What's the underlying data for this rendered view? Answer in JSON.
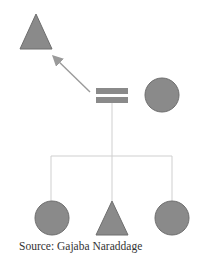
{
  "diagram": {
    "colors": {
      "shape_fill": "#8a8a8a",
      "shape_stroke": "#6e6e6e",
      "line": "#cfcfcf",
      "arrow": "#9a9a9a"
    },
    "nodes": [
      {
        "id": "parent-triangle",
        "shape": "triangle",
        "role": "male (top-left)"
      },
      {
        "id": "marriage-symbol",
        "shape": "equals",
        "role": "marriage"
      },
      {
        "id": "spouse-circle",
        "shape": "circle",
        "role": "female spouse"
      },
      {
        "id": "child-circle-left",
        "shape": "circle",
        "role": "female child"
      },
      {
        "id": "child-triangle",
        "shape": "triangle",
        "role": "male child"
      },
      {
        "id": "child-circle-right",
        "shape": "circle",
        "role": "female child"
      }
    ],
    "edges": [
      {
        "from": "marriage-symbol",
        "to": "parent-triangle",
        "type": "arrow"
      },
      {
        "from": "marriage-symbol",
        "to": "children",
        "type": "descent"
      }
    ]
  },
  "caption": {
    "text": "Source: Gajaba Naraddage"
  }
}
